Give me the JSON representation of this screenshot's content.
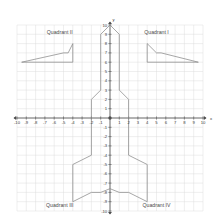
{
  "figure": {
    "title": "",
    "background": "#ffffff",
    "grid_color": "#dcdcdc",
    "axis_color": "#4d4d4d",
    "shape_color": "#8a8a8a",
    "label_color": "#4a4a4a"
  },
  "axes": {
    "x_name": "x",
    "y_name": "y",
    "xlim": [
      -10,
      10
    ],
    "ylim": [
      -10,
      10
    ],
    "x_ticks": [
      -10,
      -9,
      -8,
      -7,
      -6,
      -5,
      -4,
      -3,
      -2,
      -1,
      1,
      2,
      3,
      4,
      5,
      6,
      7,
      8,
      9,
      10
    ],
    "y_ticks": [
      10,
      9,
      8,
      7,
      6,
      5,
      4,
      3,
      2,
      1,
      -1,
      -2,
      -3,
      -4,
      -5,
      -6,
      -7,
      -8,
      -9,
      -10
    ],
    "x_tick_labels": [
      "-10",
      "-9",
      "-8",
      "-7",
      "-6",
      "-5",
      "-4",
      "-3",
      "-2",
      "-1",
      "1",
      "2",
      "3",
      "4",
      "5",
      "6",
      "7",
      "8",
      "9",
      "10"
    ],
    "y_tick_labels": [
      "10",
      "9",
      "8",
      "7",
      "6",
      "5",
      "4",
      "3",
      "2",
      "1",
      "-1",
      "-2",
      "-3",
      "-4",
      "-5",
      "-6",
      "-7",
      "-8",
      "-9",
      "-10"
    ],
    "grid": true,
    "origin_label": ""
  },
  "quadrants": [
    {
      "id": "I",
      "label": "Quadrant I",
      "x": 5.0,
      "y": 9.0
    },
    {
      "id": "II",
      "label": "Quadrant II",
      "x": -5.4,
      "y": 9.0
    },
    {
      "id": "III",
      "label": "Quadrant III",
      "x": -5.4,
      "y": -9.6
    },
    {
      "id": "IV",
      "label": "Quadrant IV",
      "x": 5.0,
      "y": -9.6
    }
  ],
  "chart_data": {
    "type": "line",
    "xlabel": "x",
    "ylabel": "y",
    "xlim": [
      -10,
      10
    ],
    "ylim": [
      -10,
      10
    ],
    "grid": true,
    "legend": "none",
    "series": [
      {
        "name": "rocket-body",
        "closed": true,
        "points": [
          [
            0,
            10
          ],
          [
            1,
            9
          ],
          [
            1,
            3
          ],
          [
            2,
            2
          ],
          [
            2,
            -4
          ],
          [
            4,
            -5
          ],
          [
            4,
            -9
          ],
          [
            2,
            -8
          ],
          [
            1,
            -8
          ],
          [
            0,
            -7.6
          ],
          [
            -1,
            -8
          ],
          [
            -2,
            -8
          ],
          [
            -4,
            -9
          ],
          [
            -4,
            -5
          ],
          [
            -2,
            -4
          ],
          [
            -2,
            2
          ],
          [
            -1,
            3
          ],
          [
            -1,
            9
          ]
        ]
      },
      {
        "name": "wing-quadrant-II",
        "closed": true,
        "points": [
          [
            -9.5,
            6
          ],
          [
            -5,
            7
          ],
          [
            -4.5,
            7
          ],
          [
            -4,
            8
          ],
          [
            -4,
            6
          ]
        ]
      },
      {
        "name": "wing-quadrant-I",
        "closed": true,
        "points": [
          [
            4,
            8
          ],
          [
            4,
            6
          ],
          [
            9.5,
            6
          ],
          [
            5.5,
            7
          ],
          [
            5,
            7
          ]
        ]
      }
    ],
    "annotations": [
      {
        "text": "Quadrant I",
        "x": 5.0,
        "y": 9.0
      },
      {
        "text": "Quadrant II",
        "x": -5.4,
        "y": 9.0
      },
      {
        "text": "Quadrant III",
        "x": -5.4,
        "y": -9.6
      },
      {
        "text": "Quadrant IV",
        "x": 5.0,
        "y": -9.6
      }
    ]
  }
}
